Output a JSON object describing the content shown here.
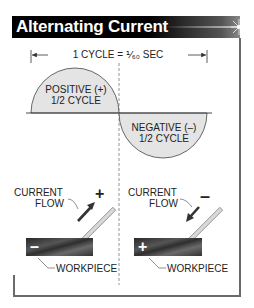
{
  "header": {
    "title": "Alternating Current"
  },
  "diagram": {
    "cycle_label": "1 CYCLE = ⅟₆₀ SEC",
    "positive_half": {
      "line1": "POSITIVE (+)",
      "line2": "1/2 CYCLE"
    },
    "negative_half": {
      "line1": "NEGATIVE (–)",
      "line2": "1/2 CYCLE"
    },
    "left_panel": {
      "current_flow_line1": "CURRENT",
      "current_flow_line2": "FLOW",
      "electrode_polarity": "+",
      "workpiece_polarity": "–",
      "workpiece_label": "WORKPIECE"
    },
    "right_panel": {
      "current_flow_line1": "CURRENT",
      "current_flow_line2": "FLOW",
      "electrode_polarity": "–",
      "workpiece_polarity": "+",
      "workpiece_label": "WORKPIECE"
    },
    "colors": {
      "header_bg": "#000000",
      "half_cycle_fill": "#e4e4e4",
      "line": "#333333",
      "workpiece": "#3a3a3a"
    }
  }
}
